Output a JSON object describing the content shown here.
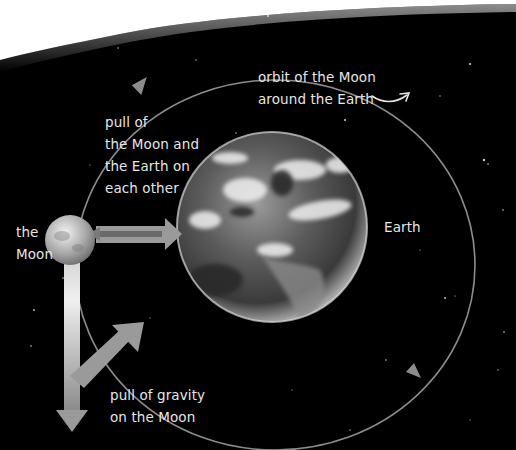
{
  "diagram": {
    "title": "Orbit of the Moon around the Earth",
    "labels": {
      "orbit_line1": "orbit of the Moon",
      "orbit_line2": "around the Earth",
      "pull_each_line1": "pull of",
      "pull_each_line2": "the Moon and",
      "pull_each_line3": "the Earth on",
      "pull_each_line4": "each other",
      "moon_line1": "the",
      "moon_line2": "Moon",
      "earth": "Earth",
      "gravity_line1": "pull of gravity",
      "gravity_line2": "on the Moon"
    },
    "elements": [
      {
        "id": "earth",
        "type": "planet"
      },
      {
        "id": "moon",
        "type": "satellite"
      },
      {
        "id": "orbit",
        "type": "elliptical-path",
        "direction": "counterclockwise"
      },
      {
        "id": "mutual-pull-arrow",
        "type": "double-arrow",
        "between": [
          "moon",
          "earth"
        ]
      },
      {
        "id": "gravity-arrows",
        "type": "vector-arrows",
        "on": "moon"
      }
    ],
    "colors": {
      "background": "#000000",
      "sky_edge": "#ffffff",
      "orbit_line": "#8a8a8a",
      "arrow": "#9a9a9a",
      "text": "#e6e6e6"
    }
  }
}
